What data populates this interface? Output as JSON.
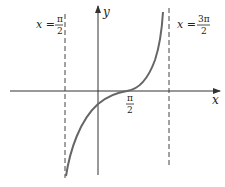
{
  "diagram": {
    "axis_x_label": "x",
    "axis_y_label": "y",
    "left_asymptote": {
      "lhs": "x =",
      "num": "π",
      "den": "2"
    },
    "right_asymptote": {
      "lhs": "x =",
      "num": "3π",
      "den": "2"
    },
    "x_intercept_label": {
      "num": "π",
      "den": "2"
    },
    "colors": {
      "curve": "#666666",
      "axes": "#333333",
      "asymptote": "#444444"
    }
  }
}
